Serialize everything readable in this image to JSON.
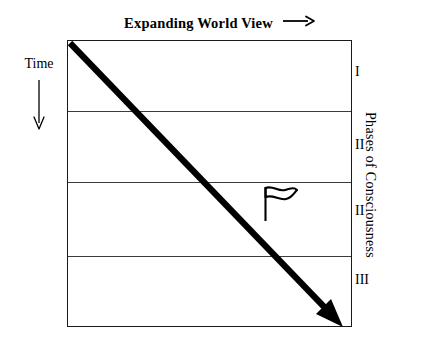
{
  "diagram": {
    "title": {
      "text": "Expanding World View",
      "arrow_icon": "right-arrow-icon"
    },
    "time_axis": {
      "label": "Time",
      "arrow_icon": "down-arrow-icon",
      "direction": "downward"
    },
    "right_axis": {
      "caption": "Phases of Consciousness",
      "orientation": "vertical"
    },
    "bands": [
      {
        "numeral": "I"
      },
      {
        "numeral": "II"
      },
      {
        "numeral": "II"
      },
      {
        "numeral": "III"
      }
    ],
    "trend_arrow": {
      "icon": "diagonal-arrow-icon",
      "from": "top-left",
      "to": "bottom-right"
    },
    "marker": {
      "icon": "flag-icon"
    },
    "colors": {
      "ink": "#000000",
      "border": "#1a1a1a",
      "divider": "#3b3b3b",
      "background": "#ffffff"
    }
  }
}
